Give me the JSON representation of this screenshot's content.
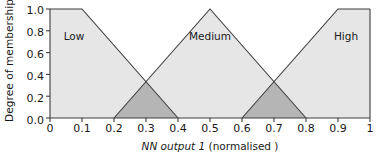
{
  "chart_data": {
    "type": "area",
    "title": "",
    "xlabel_italic": "NN output 1",
    "xlabel_rest": " (normalised )",
    "xlabel": "NN output 1 (normalised )",
    "ylabel": "Degree of membership",
    "xlim": [
      0,
      1
    ],
    "ylim": [
      0,
      1
    ],
    "grid": false,
    "legend": "none",
    "xticks": [
      "0",
      "0.1",
      "0.2",
      "0.3",
      "0.4",
      "0.5",
      "0.6",
      "0.7",
      "0.8",
      "0.9",
      "1"
    ],
    "xtick_values": [
      0,
      0.1,
      0.2,
      0.3,
      0.4,
      0.5,
      0.6,
      0.7,
      0.8,
      0.9,
      1
    ],
    "yticks": [
      "0.0",
      "0.2",
      "0.4",
      "0.6",
      "0.8",
      "1.0"
    ],
    "ytick_values": [
      0,
      0.2,
      0.4,
      0.6,
      0.8,
      1
    ],
    "series": [
      {
        "name": "Low",
        "label": "Low",
        "shape": "trapezoid",
        "x": [
          0,
          0.1,
          0.4
        ],
        "y": [
          1,
          1,
          0
        ],
        "label_x": 0.075,
        "label_y": 0.72
      },
      {
        "name": "Medium",
        "label": "Medium",
        "shape": "triangle",
        "x": [
          0.2,
          0.5,
          0.8
        ],
        "y": [
          0,
          1,
          0
        ],
        "label_x": 0.5,
        "label_y": 0.72
      },
      {
        "name": "High",
        "label": "High",
        "shape": "trapezoid",
        "x": [
          0.6,
          0.9,
          1.0
        ],
        "y": [
          0,
          1,
          1
        ],
        "label_x": 0.925,
        "label_y": 0.72
      }
    ],
    "overlaps": [
      {
        "name": "low-medium-overlap",
        "x_start": 0.2,
        "x_cross": 0.3,
        "x_end": 0.4,
        "y_cross": 0.3333
      },
      {
        "name": "medium-high-overlap",
        "x_start": 0.6,
        "x_cross": 0.7,
        "x_end": 0.8,
        "y_cross": 0.3333
      }
    ],
    "colors": {
      "fill": "#e6e6e6",
      "overlap_fill": "#b5b5b5",
      "line": "#3c3c3c",
      "axis": "#3c3c3c",
      "text": "#1a1a1a",
      "background": "#ffffff"
    }
  }
}
